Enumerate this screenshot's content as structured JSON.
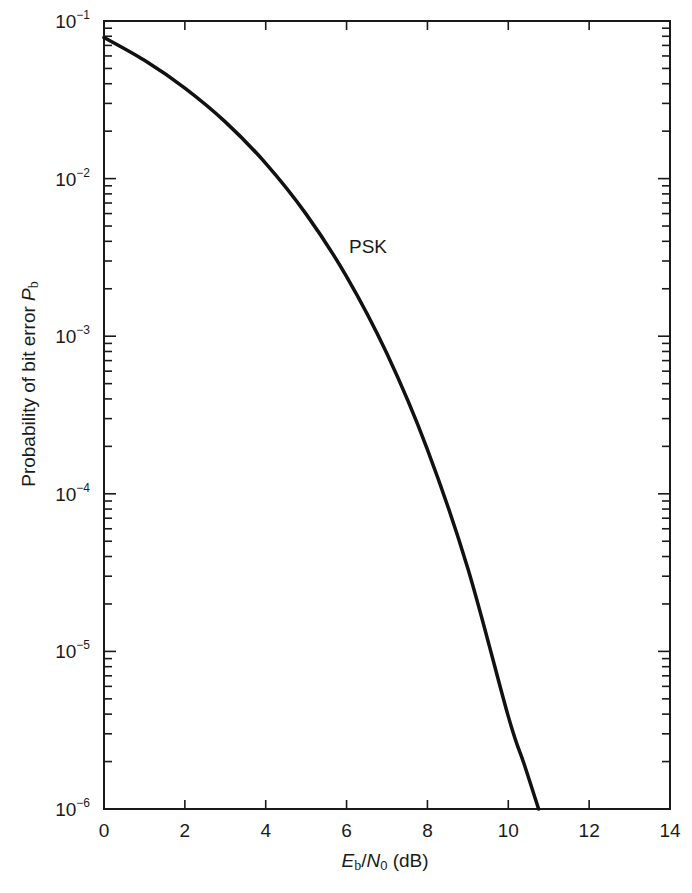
{
  "chart_data": {
    "type": "line",
    "title": "",
    "xlabel": "Eb/N0 (dB)",
    "ylabel": "Probability of bit error Pb",
    "xlim": [
      0,
      14
    ],
    "ylim": [
      1e-06,
      0.1
    ],
    "yscale": "log",
    "grid": false,
    "x_ticks": [
      0,
      2,
      4,
      6,
      8,
      10,
      12,
      14
    ],
    "y_ticks": [
      "10^-1",
      "10^-2",
      "10^-3",
      "10^-4",
      "10^-5",
      "10^-6"
    ],
    "series": [
      {
        "name": "PSK",
        "x": [
          0,
          1,
          2,
          3,
          4,
          5,
          6,
          7,
          8,
          9,
          10,
          10.4,
          10.75
        ],
        "values": [
          0.0786,
          0.0563,
          0.0375,
          0.0229,
          0.0125,
          0.00595,
          0.00239,
          0.000773,
          0.000191,
          3.36e-05,
          3.87e-06,
          1.9e-06,
          1e-06
        ]
      }
    ],
    "annotations": [
      {
        "text": "PSK",
        "x": 6.1,
        "y": 0.0033
      }
    ]
  },
  "labels": {
    "x_ticks": [
      "0",
      "2",
      "4",
      "6",
      "8",
      "10",
      "12",
      "14"
    ],
    "y_ticks": [
      {
        "base": "10",
        "exp": "−1"
      },
      {
        "base": "10",
        "exp": "−2"
      },
      {
        "base": "10",
        "exp": "−3"
      },
      {
        "base": "10",
        "exp": "−4"
      },
      {
        "base": "10",
        "exp": "−5"
      },
      {
        "base": "10",
        "exp": "−6"
      }
    ],
    "xlabel": {
      "E": "E",
      "b": "b",
      "slash": "/",
      "N": "N",
      "zero": "0",
      "unit": " (dB)"
    },
    "ylabel": {
      "text": "Probability of bit error ",
      "P": "P",
      "b": "b"
    },
    "series_label": "PSK"
  }
}
